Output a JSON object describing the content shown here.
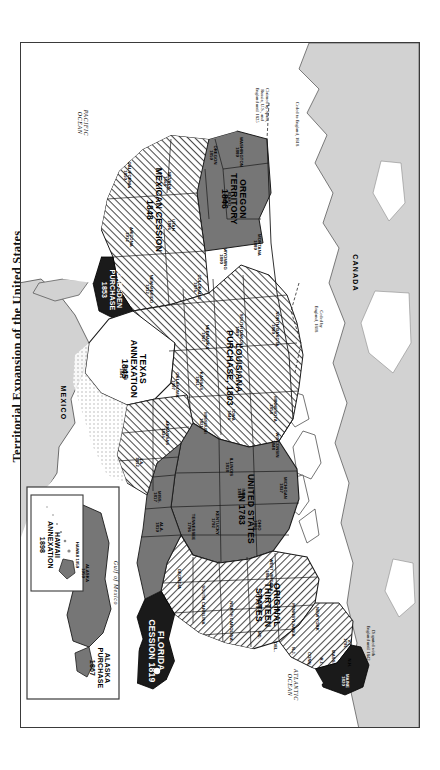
{
  "document": {
    "title": "Territorial Expansion of the United States",
    "orientation": "landscape-sheet-rotated-90",
    "page_background": "#ffffff",
    "frame_color": "#3a3a3a"
  },
  "legend_colors": {
    "original_states_hatch": "#8a8a8a",
    "acquisition_gray": "#6e6e6e",
    "acquisition_dark": "#1a1a1a",
    "foreign_land": "#d9d9d9",
    "ocean": "#ffffff",
    "hatch_stroke": "#555555"
  },
  "territories": [
    {
      "name": "UNITED STATES\nIN 1783",
      "label": "UNITED STATES IN 1783",
      "year": "1783",
      "fill": "gray"
    },
    {
      "name": "ORIGINAL\nTHIRTEEN\nSTATES",
      "label": "ORIGINAL THIRTEEN STATES",
      "year": "",
      "fill": "hatch"
    },
    {
      "name": "LOUISIANA\nPURCHASE, 1803",
      "label": "LOUISIANA PURCHASE 1803",
      "year": "1803",
      "fill": "hatch"
    },
    {
      "name": "FLORIDA\nCESSION 1819",
      "label": "FLORIDA CESSION 1819",
      "year": "1819",
      "fill": "dark"
    },
    {
      "name": "TEXAS\nANNEXATION\n1845",
      "label": "TEXAS ANNEXATION 1845",
      "year": "1845",
      "fill": "white"
    },
    {
      "name": "OREGON\nTERRITORY\n1846",
      "label": "OREGON TERRITORY 1846",
      "year": "1846",
      "fill": "gray"
    },
    {
      "name": "MEXICAN CESSION\n1848",
      "label": "MEXICAN CESSION 1848",
      "year": "1848",
      "fill": "hatch"
    },
    {
      "name": "GADSDEN\nPURCHASE\n1853",
      "label": "GADSDEN PURCHASE 1853",
      "year": "1853",
      "fill": "dark"
    },
    {
      "name": "ALASKA\nPURCHASE\n1867",
      "label": "ALASKA PURCHASE 1867",
      "year": "1867",
      "fill": "gray"
    },
    {
      "name": "HAWAII\nANNEXATION\n1898",
      "label": "HAWAII ANNEXATION 1898",
      "year": "1898",
      "fill": "gray"
    }
  ],
  "states": [
    {
      "name": "WASHINGTON",
      "year": "1889"
    },
    {
      "name": "OREGON",
      "year": "1859"
    },
    {
      "name": "IDAHO",
      "year": "1890"
    },
    {
      "name": "MONTANA",
      "year": "1889"
    },
    {
      "name": "WYOMING",
      "year": "1890"
    },
    {
      "name": "NEVADA",
      "year": "1864"
    },
    {
      "name": "UTAH",
      "year": "1896"
    },
    {
      "name": "CALIFORNIA",
      "year": "1850"
    },
    {
      "name": "ARIZONA",
      "year": "1912"
    },
    {
      "name": "NEW MEXICO",
      "year": "1912"
    },
    {
      "name": "COLORADO",
      "year": "1876"
    },
    {
      "name": "NORTH DAKOTA",
      "year": "1889"
    },
    {
      "name": "SOUTH DAKOTA",
      "year": "1889"
    },
    {
      "name": "NEBRASKA",
      "year": "1867"
    },
    {
      "name": "KANSAS",
      "year": "1861"
    },
    {
      "name": "OKLAHOMA",
      "year": "1907"
    },
    {
      "name": "TEXAS",
      "year": "1845"
    },
    {
      "name": "MINNESOTA",
      "year": "1858"
    },
    {
      "name": "IOWA",
      "year": "1846"
    },
    {
      "name": "MISSOURI",
      "year": "1821"
    },
    {
      "name": "ARKANSAS",
      "year": "1836"
    },
    {
      "name": "LA.",
      "year": "1812"
    },
    {
      "name": "WISCONSIN",
      "year": "1848"
    },
    {
      "name": "MICHIGAN",
      "year": "1837"
    },
    {
      "name": "ILLINOIS",
      "year": "1818"
    },
    {
      "name": "IND.",
      "year": "1816"
    },
    {
      "name": "OHIO",
      "year": "1803"
    },
    {
      "name": "KENTUCKY",
      "year": "1792"
    },
    {
      "name": "TENNESSEE",
      "year": "1796"
    },
    {
      "name": "MISS.",
      "year": "1817"
    },
    {
      "name": "ALA.",
      "year": "1819"
    },
    {
      "name": "GEORGIA",
      "year": ""
    },
    {
      "name": "SOUTH CAROLINA",
      "year": ""
    },
    {
      "name": "NORTH CAROLINA",
      "year": ""
    },
    {
      "name": "VIRGINIA",
      "year": ""
    },
    {
      "name": "WEST VIRGINIA",
      "year": "1863"
    },
    {
      "name": "MD.",
      "year": ""
    },
    {
      "name": "DEL.",
      "year": ""
    },
    {
      "name": "N.J.",
      "year": ""
    },
    {
      "name": "PENNSYLVANIA",
      "year": ""
    },
    {
      "name": "NEW YORK",
      "year": ""
    },
    {
      "name": "CONN.",
      "year": ""
    },
    {
      "name": "R.I.",
      "year": ""
    },
    {
      "name": "MASS.",
      "year": ""
    },
    {
      "name": "N.H.",
      "year": ""
    },
    {
      "name": "V.T.",
      "year": "1791"
    },
    {
      "name": "MAINE",
      "year": "1820"
    },
    {
      "name": "ALASKA",
      "year": "1959"
    },
    {
      "name": "HAWAII",
      "year": "1959"
    }
  ],
  "annotations": [
    {
      "text": "Claimed by Spain,\nRussia, U.S., and\nEngland until 1825"
    },
    {
      "text": "Ceded to England, 1818"
    },
    {
      "text": "Ceded by\nEngland, 1818"
    },
    {
      "text": "Disputed with\nEngland until 1842"
    }
  ],
  "geography": [
    {
      "name": "CANADA",
      "kind": "country"
    },
    {
      "name": "MEXICO",
      "kind": "country"
    },
    {
      "name": "ATLANTIC\nOCEAN",
      "kind": "ocean"
    },
    {
      "name": "PACIFIC\nOCEAN",
      "kind": "ocean"
    },
    {
      "name": "Gulf of Mexico",
      "kind": "sea"
    }
  ],
  "insets": [
    {
      "name": "alaska-inset",
      "contents": "ALASKA PURCHASE 1867 / ALASKA 1959"
    },
    {
      "name": "hawaii-inset",
      "contents": "HAWAII ANNEXATION 1898 / HAWAII 1959"
    }
  ]
}
